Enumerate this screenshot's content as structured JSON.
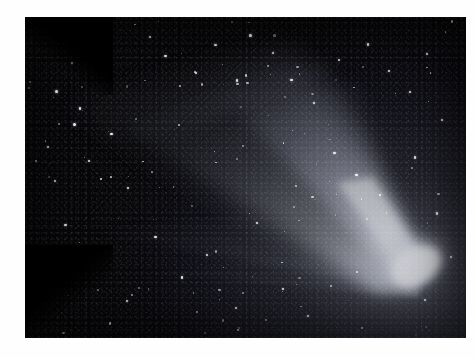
{
  "image": {
    "subject": "comet",
    "title": "Comet with broad dust tail and fainter ion tail",
    "caption": "",
    "border_color": "#fefefe",
    "sky_color": "#0a0a10",
    "coma_color": "#ffffff",
    "tail_color": "#c9ccd8",
    "frame": {
      "x": 25,
      "y": 17,
      "width": 441,
      "height": 321
    }
  },
  "features": {
    "nucleus": {
      "name": "comet-nucleus",
      "x": 0.885,
      "y": 0.775,
      "brightness": 1.0
    },
    "coma": {
      "name": "comet-coma",
      "rx": 0.085,
      "ry": 0.075
    },
    "dust_tail": {
      "name": "dust-tail",
      "direction": "upper-left",
      "angle_deg": 208,
      "length": 0.82,
      "opening_deg": 34,
      "description": "broad fan-shaped dust tail sweeping to the upper left"
    },
    "ion_tail": {
      "name": "ion-tail",
      "direction": "left",
      "angle_deg": 196,
      "length": 0.74,
      "opening_deg": 6,
      "description": "narrow faint streamer below the dust tail"
    },
    "dark_lane": {
      "name": "dark-lane",
      "description": "dark separation lane between the dust tail lobes"
    },
    "vignette": {
      "name": "corner-vignette",
      "corners": [
        "top-left",
        "bottom-left"
      ],
      "color": "#000000"
    }
  },
  "stars": {
    "count": 180,
    "bright": [
      {
        "x": 0.072,
        "y": 0.233,
        "r": 1.7
      },
      {
        "x": 0.172,
        "y": 0.092,
        "r": 1.2
      },
      {
        "x": 0.107,
        "y": 0.144,
        "r": 1.0
      },
      {
        "x": 0.283,
        "y": 0.062,
        "r": 1.1
      },
      {
        "x": 0.125,
        "y": 0.285,
        "r": 1.2
      },
      {
        "x": 0.112,
        "y": 0.334,
        "r": 1.5
      },
      {
        "x": 0.196,
        "y": 0.365,
        "r": 1.3
      },
      {
        "x": 0.052,
        "y": 0.404,
        "r": 1.0
      },
      {
        "x": 0.145,
        "y": 0.448,
        "r": 1.2
      },
      {
        "x": 0.067,
        "y": 0.512,
        "r": 1.0
      },
      {
        "x": 0.233,
        "y": 0.532,
        "r": 1.1
      },
      {
        "x": 0.318,
        "y": 0.122,
        "r": 1.3
      },
      {
        "x": 0.388,
        "y": 0.173,
        "r": 1.0
      },
      {
        "x": 0.432,
        "y": 0.088,
        "r": 1.2
      },
      {
        "x": 0.512,
        "y": 0.059,
        "r": 1.5
      },
      {
        "x": 0.562,
        "y": 0.112,
        "r": 1.0
      },
      {
        "x": 0.481,
        "y": 0.198,
        "r": 1.1
      },
      {
        "x": 0.604,
        "y": 0.196,
        "r": 1.2
      },
      {
        "x": 0.655,
        "y": 0.267,
        "r": 1.1
      },
      {
        "x": 0.712,
        "y": 0.134,
        "r": 1.0
      },
      {
        "x": 0.778,
        "y": 0.086,
        "r": 1.3
      },
      {
        "x": 0.826,
        "y": 0.168,
        "r": 1.1
      },
      {
        "x": 0.872,
        "y": 0.234,
        "r": 1.0
      },
      {
        "x": 0.912,
        "y": 0.115,
        "r": 1.2
      },
      {
        "x": 0.946,
        "y": 0.322,
        "r": 1.1
      },
      {
        "x": 0.702,
        "y": 0.424,
        "r": 1.2
      },
      {
        "x": 0.752,
        "y": 0.492,
        "r": 1.3
      },
      {
        "x": 0.806,
        "y": 0.556,
        "r": 1.0
      },
      {
        "x": 0.884,
        "y": 0.438,
        "r": 1.1
      },
      {
        "x": 0.934,
        "y": 0.612,
        "r": 1.2
      },
      {
        "x": 0.296,
        "y": 0.686,
        "r": 1.1
      },
      {
        "x": 0.412,
        "y": 0.742,
        "r": 1.0
      },
      {
        "x": 0.356,
        "y": 0.812,
        "r": 1.2
      },
      {
        "x": 0.232,
        "y": 0.886,
        "r": 1.1
      },
      {
        "x": 0.478,
        "y": 0.908,
        "r": 1.0
      },
      {
        "x": 0.585,
        "y": 0.848,
        "r": 1.1
      },
      {
        "x": 0.642,
        "y": 0.932,
        "r": 1.0
      },
      {
        "x": 0.162,
        "y": 0.742,
        "r": 1.0
      },
      {
        "x": 0.092,
        "y": 0.648,
        "r": 1.1
      },
      {
        "x": 0.525,
        "y": 0.642,
        "r": 1.0
      },
      {
        "x": 0.966,
        "y": 0.748,
        "r": 1.1
      },
      {
        "x": 0.908,
        "y": 0.882,
        "r": 1.0
      }
    ]
  }
}
